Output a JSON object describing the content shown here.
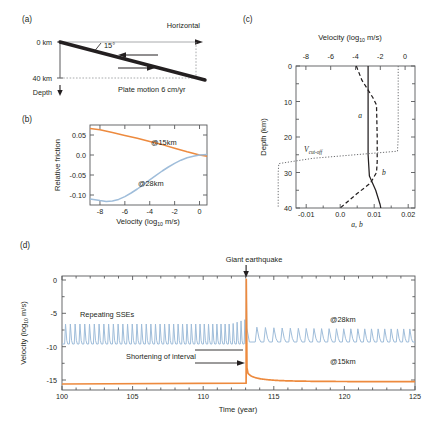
{
  "figure": {
    "panels": [
      "a",
      "b",
      "c",
      "d"
    ],
    "colors": {
      "orange_15km": "#ED8A3E",
      "blue_28km": "#9FBDDA",
      "axis": "#58595b",
      "text": "#231f20",
      "slab": "#231f20"
    }
  },
  "panel_a": {
    "label": "(a)",
    "top_depth_label": "0 km",
    "bottom_depth_label": "40 km",
    "depth_axis_label": "Depth",
    "horizontal_label": "Horizontal",
    "dip_angle_label": "15°",
    "plate_motion_label": "Plate motion 6 cm/yr"
  },
  "panel_b": {
    "label": "(b)",
    "ylabel": "Relative friction",
    "xlabel_main": "Velocity (log",
    "xlabel_sub": "10",
    "xlabel_tail": " m/s)",
    "yticks": [
      "0.05",
      "0.0",
      "-0.05",
      "-0.10"
    ],
    "xticks": [
      "-8",
      "-6",
      "-4",
      "-2",
      "0"
    ],
    "series_label_15km": "@15km",
    "series_label_28km": "@28km",
    "chart_data": {
      "type": "line",
      "title": "",
      "xlabel": "Velocity (log10 m/s)",
      "ylabel": "Relative friction",
      "xlim": [
        -8.8,
        0.6
      ],
      "ylim": [
        -0.125,
        0.075
      ],
      "grid": false,
      "legend_position": "inline-annotation",
      "series": [
        {
          "name": "@15km",
          "color": "#ED8A3E",
          "x": [
            -8.5,
            -8.0,
            -7.0,
            -6.0,
            -5.0,
            -4.0,
            -3.0,
            -2.0,
            -1.0,
            0.0,
            0.5
          ],
          "y": [
            0.066,
            0.063,
            0.056,
            0.049,
            0.042,
            0.034,
            0.026,
            0.017,
            0.008,
            0.0,
            -0.003
          ]
        },
        {
          "name": "@28km",
          "color": "#9FBDDA",
          "x": [
            -8.5,
            -8.0,
            -7.5,
            -7.0,
            -6.5,
            -6.0,
            -5.5,
            -5.0,
            -4.5,
            -4.0,
            -3.5,
            -3.0,
            -2.5,
            -2.0,
            -1.5,
            -1.0,
            -0.5,
            0.0,
            0.5
          ],
          "y": [
            -0.11,
            -0.114,
            -0.116,
            -0.115,
            -0.111,
            -0.104,
            -0.095,
            -0.085,
            -0.074,
            -0.062,
            -0.051,
            -0.04,
            -0.03,
            -0.021,
            -0.013,
            -0.007,
            -0.003,
            0.0,
            0.001
          ]
        }
      ]
    }
  },
  "panel_c": {
    "label": "(c)",
    "top_axis_label_main": "Velocity (log",
    "top_axis_label_sub": "10",
    "top_axis_label_tail": " m/s)",
    "ylabel": "Depth (km)",
    "xlabel_bottom": "a, b",
    "top_xticks": [
      "-8",
      "-6",
      "-4",
      "-2",
      "0"
    ],
    "yticks": [
      "0",
      "10",
      "20",
      "30",
      "40"
    ],
    "bottom_xticks": [
      "-0.01",
      "0.0",
      "0.01",
      "0.02"
    ],
    "curve_label_a": "a",
    "curve_label_b": "b",
    "curve_label_vcutoff_main": "V",
    "curve_label_vcutoff_sub": "cut-off",
    "chart_data": {
      "type": "line",
      "title": "",
      "xlabel": "a, b",
      "xlabel_top": "Velocity (log10 m/s)",
      "ylabel": "Depth (km)",
      "xlim_bottom": [
        -0.013,
        0.022
      ],
      "xlim_top": [
        -8.8,
        0.8
      ],
      "ylim": [
        40,
        0
      ],
      "grid": false,
      "series": [
        {
          "name": "a",
          "style": "solid",
          "axis": "bottom",
          "x": [
            0.0082,
            0.0082,
            0.0082,
            0.0082,
            0.0086,
            0.0105,
            0.0118,
            0.012
          ],
          "depth": [
            0,
            5,
            15,
            25,
            31,
            35,
            39,
            40
          ]
        },
        {
          "name": "b",
          "style": "dashed",
          "axis": "bottom",
          "x": [
            0.0048,
            0.0075,
            0.0108,
            0.0118,
            0.012,
            0.012,
            0.0118,
            0.01,
            0.006,
            0.0
          ],
          "depth": [
            0,
            4,
            9,
            11,
            20,
            27,
            30,
            33,
            36,
            40
          ]
        },
        {
          "name": "Vcut-off",
          "style": "dotted",
          "axis": "bottom",
          "x": [
            0.017,
            0.017,
            0.017,
            0.0168,
            0.005,
            -0.005,
            -0.0052,
            -0.0052,
            -0.0052
          ],
          "depth": [
            0,
            10,
            20,
            24,
            26,
            27.5,
            30,
            35,
            40
          ]
        }
      ]
    }
  },
  "panel_d": {
    "label": "(d)",
    "ylabel_main": "Velocity (log",
    "ylabel_sub": "10",
    "ylabel_tail": " m/s)",
    "xlabel": "Time (year)",
    "yticks": [
      "0",
      "-5",
      "-10",
      "-15"
    ],
    "xticks": [
      "100",
      "105",
      "110",
      "115",
      "120",
      "125"
    ],
    "ann_repeating_sses": "Repeating SSEs",
    "ann_giant_earthquake": "Giant earthquake",
    "ann_shortening": "Shortening of interval",
    "series_label_28km": "@28km",
    "series_label_15km": "@15km",
    "chart_data": {
      "type": "line",
      "title": "",
      "xlabel": "Time (year)",
      "ylabel": "Velocity (log10 m/s)",
      "xlim": [
        100,
        125
      ],
      "ylim": [
        -16.5,
        0.6
      ],
      "grid": false,
      "earthquake_time": 113.05,
      "earthquake_peak": 0.1,
      "series": [
        {
          "name": "@28km",
          "color": "#9FBDDA",
          "description": "Repeating slow slip events: periodic spikes from baseline -9.6 to peak -6.6 before the earthquake (interval ~0.33 yr, shortening near 113); after the earthquake spikes restart sparse (interval ~0.55 yr) from baseline -9.3 to peak -7.0 and progressively densify toward year 125",
          "pre_baseline": -9.6,
          "pre_peak": -6.6,
          "pre_interval_start": 0.34,
          "pre_interval_end": 0.27,
          "post_baseline": -9.3,
          "post_peak": -7.0,
          "post_interval_start": 0.62,
          "post_interval_end": 0.42
        },
        {
          "name": "@15km",
          "color": "#ED8A3E",
          "description": "Locked zone velocity near -15.6 before earthquake, jumps to 0 at the earthquake, then decays to about -15.2 by year 125",
          "pre_value": -15.6,
          "post_decay_from": -13.2,
          "post_decay_to": -15.25
        }
      ]
    }
  }
}
